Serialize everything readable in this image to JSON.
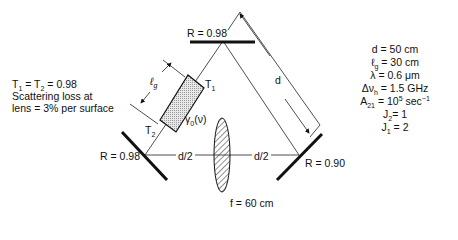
{
  "diagram": {
    "type": "ring laser cavity",
    "mirrors": [
      {
        "id": "top",
        "label": "R = 0.98"
      },
      {
        "id": "left",
        "label": "R = 0.98"
      },
      {
        "id": "right",
        "label": "R = 0.90"
      }
    ],
    "gain_medium": {
      "length_label": "ℓ",
      "length_sub": "g",
      "face1": "T",
      "face1_sub": "1",
      "face2": "T",
      "face2_sub": "2",
      "gain_label": "γ",
      "gain_sub": "0",
      "gain_arg": "(ν)"
    },
    "lens": {
      "label": "f = 60 cm"
    },
    "distances": {
      "left_half": "d/2",
      "right_half": "d/2",
      "side": "d"
    }
  },
  "left_notes": {
    "line1_a": "T",
    "line1_sub1": "1",
    "line1_b": " = T",
    "line1_sub2": "2",
    "line1_c": " = 0.98",
    "line2": "Scattering loss at",
    "line3": "lens = 3% per surface"
  },
  "params": [
    {
      "sym": "d",
      "sub": "",
      "val": " = 50 cm"
    },
    {
      "sym": "ℓ",
      "sub": "g",
      "val": " = 30 cm"
    },
    {
      "sym": "λ",
      "sub": "",
      "val": " = 0.6 μm"
    },
    {
      "sym": "Δν",
      "sub": "h",
      "val": " = 1.5 GHz"
    },
    {
      "sym": "A",
      "sub": "21",
      "val": " = 10",
      "sup": "5",
      "val2": " sec",
      "sup2": "−1"
    },
    {
      "sym": "J",
      "sub": "2",
      "val": "= 1"
    },
    {
      "sym": "J",
      "sub": "1",
      "val": " = 2"
    }
  ]
}
